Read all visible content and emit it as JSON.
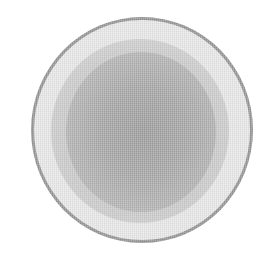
{
  "image": {
    "subject": "circular dish, top view",
    "description": "Grayscale image of a round dish with a light outer rim and a darker textured center",
    "colors": {
      "background": "#ffffff",
      "rim_outline": "#9a9a9a",
      "rim_fill": "#ececec",
      "ring_fill": "#d0d0d0",
      "center_fill": "#a8a8a8"
    }
  }
}
